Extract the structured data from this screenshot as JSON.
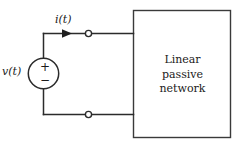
{
  "figure": {
    "kind": "circuit-diagram",
    "width": 239,
    "height": 148,
    "background_color": "#ffffff",
    "stroke_color": "#2b2b2b",
    "text_color": "#1a1a1a"
  },
  "source": {
    "label": "v(t)",
    "polarity_plus": "+",
    "polarity_minus": "−",
    "symbol_name": "independent-voltage-source"
  },
  "current": {
    "label": "i(t)",
    "direction": "right"
  },
  "network_box": {
    "lines": [
      "Linear",
      "passive",
      "network"
    ],
    "line1": "Linear",
    "line2": "passive",
    "line3": "network"
  },
  "terminals": {
    "top_label": "",
    "bottom_label": "",
    "count": 2
  }
}
